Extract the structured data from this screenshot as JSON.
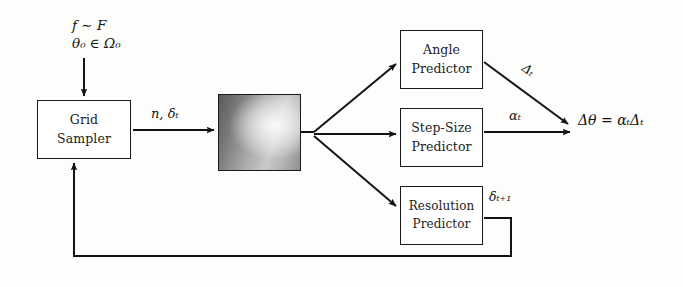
{
  "diagram": {
    "background_color": "#fdfdfc",
    "stroke_color": "#1a1a1a",
    "text_color": "#1c1c1c"
  },
  "inputs": {
    "function_sample": "f ∼ F",
    "initial_parameter": "θ₀ ∈ Ω₀"
  },
  "nodes": {
    "grid_sampler": {
      "line1": "Grid",
      "line2": "Sampler"
    },
    "angle_predictor": {
      "line1": "Angle",
      "line2": "Predictor"
    },
    "step_size_predictor": {
      "line1": "Step-Size",
      "line2": "Predictor"
    },
    "resolution_predictor": {
      "line1": "Resolution",
      "line2": "Predictor"
    },
    "feature_patch": {
      "label": "sampled-grid-patch"
    }
  },
  "edge_labels": {
    "sampler_to_patch": "n, δₜ",
    "angle_output": "Δₜ",
    "step_size_output": "αₜ",
    "resolution_output": "δₜ₊₁"
  },
  "output": {
    "equation": "Δθ = αₜΔₜ"
  }
}
